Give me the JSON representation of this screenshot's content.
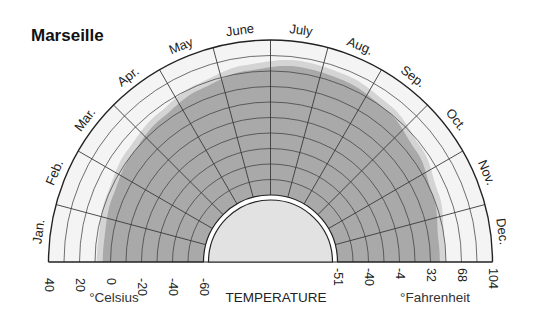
{
  "title": "Marseille",
  "chart_data": {
    "type": "radial-area",
    "title": "Marseille",
    "xlabel": "TEMPERATURE",
    "months": [
      "Jan.",
      "Feb.",
      "Mar.",
      "Apr.",
      "May",
      "June",
      "July",
      "Aug.",
      "Sep.",
      "Oct.",
      "Nov.",
      "Dec."
    ],
    "series": [
      {
        "name": "Temperature (°C)",
        "values": [
          5,
          7,
          10,
          13,
          17,
          21,
          24,
          23,
          20,
          15,
          10,
          6
        ]
      }
    ],
    "celsius_scale": {
      "label": "°Celsius",
      "ticks": [
        "40",
        "20",
        "0",
        "-20",
        "-40",
        "-60"
      ],
      "range": [
        -60,
        40
      ],
      "grid_step": 10
    },
    "fahrenheit_scale": {
      "label": "°Fahrenheit",
      "ticks": [
        "-51",
        "-40",
        "-4",
        "32",
        "68",
        "104"
      ]
    },
    "center_label": "TEMPERATURE",
    "grid": true
  },
  "colors": {
    "area": "#a9a9a9",
    "area_edge": "#d4d4d4",
    "band": "#f4f4f4",
    "grid": "#3a3a3a",
    "inner_disk": "#e2e2e2"
  }
}
